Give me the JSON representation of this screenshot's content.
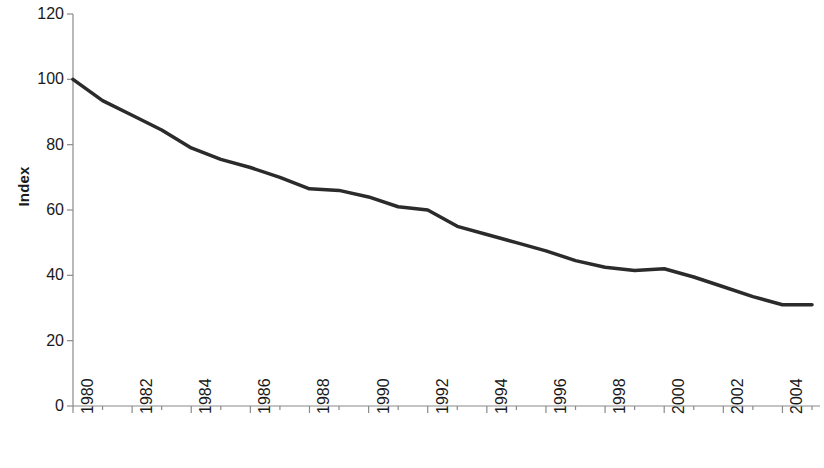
{
  "chart_data": {
    "type": "line",
    "title": "",
    "subtitle": "",
    "xlabel": "",
    "ylabel": "Index",
    "xlim": [
      1980,
      2005
    ],
    "ylim": [
      0,
      120
    ],
    "grid": false,
    "legend": "none",
    "y_ticks": [
      120,
      100,
      80,
      60,
      40,
      20,
      0
    ],
    "x_ticks": [
      1980,
      1982,
      1984,
      1986,
      1988,
      1990,
      1992,
      1994,
      1996,
      1998,
      2000,
      2002,
      2004
    ],
    "x_tick_labels": [
      "1980",
      "1982",
      "1984",
      "1986",
      "1988",
      "1990",
      "1992",
      "1994",
      "1996",
      "1998",
      "2000",
      "2002",
      "2004"
    ],
    "series": [
      {
        "name": "Index",
        "color": "#2b2b2b",
        "line_width": 3.5,
        "x": [
          1980,
          1981,
          1982,
          1983,
          1984,
          1985,
          1986,
          1987,
          1988,
          1989,
          1990,
          1991,
          1992,
          1993,
          1994,
          1995,
          1996,
          1997,
          1998,
          1999,
          2000,
          2001,
          2002,
          2003,
          2004,
          2005
        ],
        "values": [
          100.0,
          93.5,
          89.0,
          84.5,
          79.0,
          75.5,
          73.0,
          70.0,
          66.5,
          66.0,
          64.0,
          61.0,
          60.0,
          55.0,
          52.5,
          50.0,
          47.5,
          44.5,
          42.5,
          41.5,
          42.0,
          39.5,
          36.5,
          33.5,
          31.0,
          31.0
        ]
      }
    ],
    "data_points": [
      {
        "year": 1980,
        "value": 100.0
      },
      {
        "year": 1981,
        "value": 93.5
      },
      {
        "year": 1982,
        "value": 89.0
      },
      {
        "year": 1983,
        "value": 84.5
      },
      {
        "year": 1984,
        "value": 79.0
      },
      {
        "year": 1985,
        "value": 75.5
      },
      {
        "year": 1986,
        "value": 73.0
      },
      {
        "year": 1987,
        "value": 70.0
      },
      {
        "year": 1988,
        "value": 66.5
      },
      {
        "year": 1989,
        "value": 66.0
      },
      {
        "year": 1990,
        "value": 64.0
      },
      {
        "year": 1991,
        "value": 61.0
      },
      {
        "year": 1992,
        "value": 60.0
      },
      {
        "year": 1993,
        "value": 55.0
      },
      {
        "year": 1994,
        "value": 52.5
      },
      {
        "year": 1995,
        "value": 50.0
      },
      {
        "year": 1996,
        "value": 47.5
      },
      {
        "year": 1997,
        "value": 44.5
      },
      {
        "year": 1998,
        "value": 42.5
      },
      {
        "year": 1999,
        "value": 41.5
      },
      {
        "year": 2000,
        "value": 42.0
      },
      {
        "year": 2001,
        "value": 39.5
      },
      {
        "year": 2002,
        "value": 36.5
      },
      {
        "year": 2003,
        "value": 33.5
      },
      {
        "year": 2004,
        "value": 31.0
      },
      {
        "year": 2005,
        "value": 31.0
      }
    ],
    "axis_color": "#8a8a8a",
    "background_color": "#ffffff"
  }
}
